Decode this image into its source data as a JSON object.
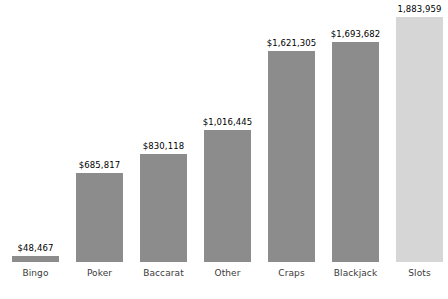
{
  "chart_data": {
    "type": "bar",
    "title": "",
    "subtitle": "",
    "xlabel": "",
    "ylabel": "",
    "grid": false,
    "legend": "none",
    "categories": [
      "Bingo",
      "Poker",
      "Baccarat",
      "Other",
      "Craps",
      "Blackjack",
      "Slots"
    ],
    "values": [
      48467,
      685817,
      830118,
      1016445,
      1621305,
      1693682,
      1883959
    ],
    "value_labels": [
      "$48,467",
      "$685,817",
      "$830,118",
      "$1,016,445",
      "$1,621,305",
      "$1,693,682",
      "1,883,959"
    ],
    "ylim": [
      0,
      1883959
    ],
    "bar_colors": [
      "#8c8c8c",
      "#8c8c8c",
      "#8c8c8c",
      "#8c8c8c",
      "#8c8c8c",
      "#8c8c8c",
      "#d6d6d6"
    ],
    "highlight_category": "Slots",
    "background_color": "#ffffff",
    "label_color": "#3a3a3a",
    "value_color": "#000000"
  },
  "layout": {
    "bar_width_px": 47,
    "bar_gap_px": 17,
    "left_margin_px": 12,
    "baseline_from_bottom_px": 37,
    "max_bar_height_px": 245
  }
}
